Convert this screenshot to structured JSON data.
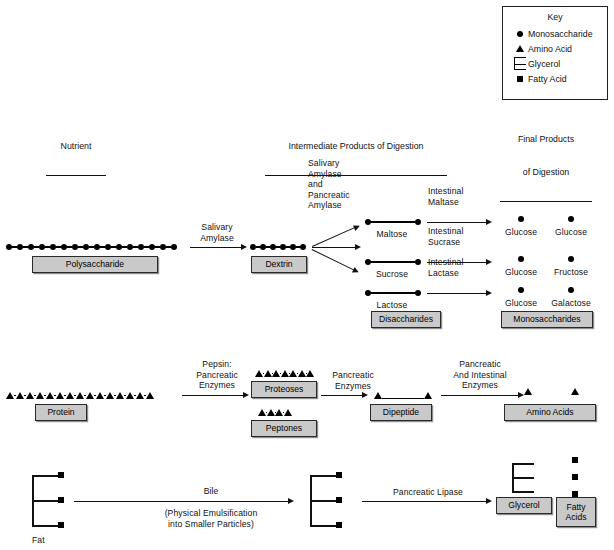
{
  "key": {
    "title": "Key",
    "items": [
      {
        "symbol": "circle",
        "symbol_name": "monosaccharide-circle-icon",
        "label": "Monosaccharide"
      },
      {
        "symbol": "triangle",
        "symbol_name": "amino-acid-triangle-icon",
        "label": "Amino Acid"
      },
      {
        "symbol": "comb",
        "symbol_name": "glycerol-comb-icon",
        "label": "Glycerol"
      },
      {
        "symbol": "square",
        "symbol_name": "fatty-acid-square-icon",
        "label": "Fatty Acid"
      }
    ]
  },
  "headers": {
    "nutrient": "Nutrient",
    "intermediate": "Intermediate Products of Digestion",
    "final_line1": "Final Products",
    "final_line2": "of Digestion"
  },
  "carbohydrate": {
    "nutrient_box": "Polysaccharide",
    "polysaccharide_units": 16,
    "enzyme_1": "Salivary\nAmylase",
    "intermediate_box_1": "Dextrin",
    "dextrin_units": 6,
    "enzyme_2": "Salivary\nAmylase\nand\nPancreatic\nAmylase",
    "disaccharides": [
      {
        "name": "Maltose",
        "enzyme": "Intestinal\nMaltase",
        "products": [
          "Glucose",
          "Glucose"
        ]
      },
      {
        "name": "Sucrose",
        "enzyme": "Intestinal\nSucrase",
        "products": [
          "Glucose",
          "Fructose"
        ]
      },
      {
        "name": "Lactose",
        "enzyme": "Intestinal\nLactase",
        "products": [
          "Glucose",
          "Galactose"
        ]
      }
    ],
    "disaccharides_box": "Disaccharides",
    "monosaccharides_box": "Monosaccharides"
  },
  "protein": {
    "nutrient_box": "Protein",
    "protein_units": 15,
    "enzyme_1": "Pepsin:\nPancreatic\nEnzymes",
    "intermediate_box_1": "Proteoses",
    "proteoses_units": 7,
    "intermediate_box_2": "Peptones",
    "peptones_units": 4,
    "enzyme_2": "Pancreatic\nEnzymes",
    "intermediate_box_3": "Dipeptide",
    "dipeptide_units": 2,
    "enzyme_3": "Pancreatic\nAnd Intestinal\nEnzymes",
    "final_box": "Amino Acids",
    "amino_acid_units": 2
  },
  "fat": {
    "nutrient_label": "Fat",
    "fat_units": 3,
    "enzyme_1": "Bile",
    "enzyme_1_note": "(Physical Emulsification\ninto Smaller Particles)",
    "intermediate_units": 3,
    "enzyme_2": "Pancreatic Lipase",
    "final_box_1": "Glycerol",
    "final_box_2": "Fatty\nAcids",
    "fatty_acid_units": 3
  },
  "colors": {
    "box_fill": "#c9c9c9",
    "box_border": "#2a2a2a",
    "ink": "#111111"
  }
}
